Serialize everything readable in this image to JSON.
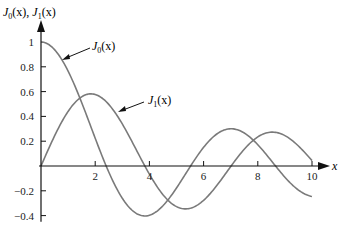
{
  "chart_data": {
    "type": "line",
    "title": "",
    "ylabel": "J0(x), J1(x)",
    "xlabel": "x",
    "xlim": [
      0,
      10
    ],
    "ylim": [
      -0.4,
      1.0
    ],
    "x_ticks": [
      "2",
      "4",
      "6",
      "8",
      "10"
    ],
    "y_ticks": [
      "1",
      "0.8",
      "0.6",
      "0.4",
      "0.2",
      "-0.2",
      "-0.4"
    ],
    "grid": false,
    "legend": "annotations with arrows",
    "series": [
      {
        "name": "J0(x)",
        "x": [
          0,
          1,
          2,
          2.405,
          3,
          3.83,
          4,
          5,
          5.52,
          6,
          7,
          7.02,
          8,
          8.65,
          9,
          10
        ],
        "values": [
          1.0,
          0.765,
          0.224,
          0.0,
          -0.26,
          -0.403,
          -0.397,
          -0.178,
          0.0,
          0.151,
          0.3,
          0.3,
          0.172,
          0.0,
          -0.09,
          -0.246
        ]
      },
      {
        "name": "J1(x)",
        "x": [
          0,
          1,
          1.84,
          2,
          3,
          3.83,
          4,
          5,
          5.33,
          6,
          7,
          7.02,
          8,
          8.54,
          9,
          10
        ],
        "values": [
          0.0,
          0.44,
          0.582,
          0.577,
          0.339,
          0.0,
          -0.066,
          -0.328,
          -0.346,
          -0.277,
          -0.005,
          0.0,
          0.235,
          0.273,
          0.245,
          0.043
        ]
      }
    ],
    "annotations": [
      {
        "text": "J0(x)",
        "points_to": "J0 curve near x=0.6"
      },
      {
        "text": "J1(x)",
        "points_to": "J1 curve near x=3"
      }
    ]
  },
  "labels": {
    "y_axis_title_main": "J",
    "x_axis_title": "x",
    "j0_label_J": "J",
    "j0_label_sub": "0",
    "j0_label_rest": "(x)",
    "j1_label_J": "J",
    "j1_label_sub": "1",
    "j1_label_rest": "(x)",
    "y_title_a_J": "J",
    "y_title_a_sub": "0",
    "y_title_a_rest": "(x), ",
    "y_title_b_J": "J",
    "y_title_b_sub": "1",
    "y_title_b_rest": "(x)"
  },
  "colors": {
    "curve": "#7a7a7a",
    "axis": "#111111"
  }
}
